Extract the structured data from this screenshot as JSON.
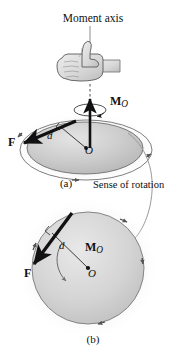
{
  "figure": {
    "title": "Moment axis",
    "sense_of_rotation": "Sense of rotation",
    "caption_a": "(a)",
    "caption_b": "(b)",
    "colors": {
      "disk_fill": "#c9c9c9",
      "disk_edge": "#6b6b6b",
      "circle_fill": "#d0d0d0",
      "circle_edge": "#7a7a7a",
      "vector_black": "#111111",
      "leader_grey": "#8c8c8c",
      "hand_fill": "#dedede",
      "hand_edge": "#5a5a5a",
      "text": "#111111"
    }
  },
  "panel_a": {
    "moment_vector": {
      "symbol": "M",
      "subscript": "O"
    },
    "force_vector": {
      "symbol": "F"
    },
    "moment_arm": {
      "symbol": "d"
    },
    "origin": {
      "symbol": "O"
    },
    "axis_label": "Moment axis",
    "hand_icon": "thumbs-up-right-hand-rule"
  },
  "panel_b": {
    "moment_vector": {
      "symbol": "M",
      "subscript": "O"
    },
    "force_vector": {
      "symbol": "F"
    },
    "moment_arm": {
      "symbol": "d"
    },
    "origin": {
      "symbol": "O"
    }
  }
}
